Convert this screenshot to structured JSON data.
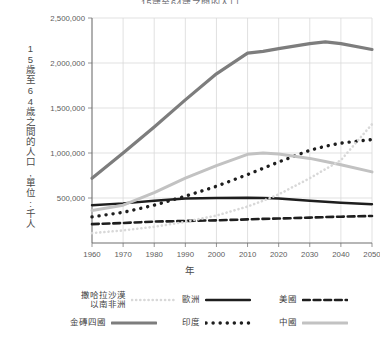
{
  "chart_data": {
    "type": "line",
    "title": "15歲至64歲之間的人口",
    "xlabel": "年",
    "ylabel": "15歲至64歲之間的人口,單位:千人",
    "grid": true,
    "legend_position": "bottom",
    "xlim": [
      1960,
      2050
    ],
    "ylim": [
      0,
      2500000
    ],
    "xticks": [
      1960,
      1970,
      1980,
      1990,
      2000,
      2010,
      2020,
      2030,
      2040,
      2050
    ],
    "xtick_labels": [
      "1960",
      "1970",
      "1980",
      "1990",
      "2000",
      "2010",
      "2020",
      "2030",
      "2040",
      "2050"
    ],
    "yticks": [
      500000,
      1000000,
      1500000,
      2000000,
      2500000
    ],
    "ytick_labels": [
      "500,000",
      "1,000,000",
      "1,500,000",
      "2,000,000",
      "2,500,000"
    ],
    "x": [
      1960,
      1970,
      1980,
      1990,
      2000,
      2010,
      2015,
      2020,
      2030,
      2035,
      2040,
      2050
    ],
    "series": [
      {
        "name": "金磚四國",
        "key": "bric",
        "style": "solid",
        "color": "#7d7d7d",
        "width": 3.2,
        "values": [
          720000,
          1000000,
          1290000,
          1590000,
          1880000,
          2110000,
          2130000,
          2160000,
          2215000,
          2235000,
          2215000,
          2150000
        ]
      },
      {
        "name": "歐洲",
        "key": "europe",
        "style": "solid",
        "color": "#1e1e1e",
        "width": 2.4,
        "values": [
          420000,
          440000,
          470000,
          495000,
          500000,
          503000,
          500000,
          495000,
          470000,
          458000,
          448000,
          430000
        ]
      },
      {
        "name": "美國",
        "key": "usa",
        "style": "dashed",
        "color": "#1e1e1e",
        "width": 2.6,
        "values": [
          210000,
          222000,
          238000,
          245000,
          252000,
          262000,
          268000,
          272000,
          282000,
          288000,
          292000,
          300000
        ]
      },
      {
        "name": "印度",
        "key": "india",
        "style": "dotted",
        "color": "#1e1e1e",
        "width": 3.4,
        "values": [
          290000,
          340000,
          420000,
          520000,
          630000,
          760000,
          830000,
          900000,
          1030000,
          1075000,
          1110000,
          1150000
        ]
      },
      {
        "name": "中國",
        "key": "china",
        "style": "solid",
        "color": "#c2c2c2",
        "width": 3.0,
        "values": [
          360000,
          420000,
          560000,
          720000,
          860000,
          985000,
          1000000,
          990000,
          940000,
          905000,
          870000,
          790000
        ]
      },
      {
        "name": "撒哈拉沙漠\n以南非洲",
        "key": "africa",
        "style": "fine-dotted",
        "color": "#d8d8d8",
        "width": 2.6,
        "values": [
          110000,
          140000,
          180000,
          235000,
          305000,
          405000,
          470000,
          540000,
          720000,
          820000,
          920000,
          1320000
        ]
      }
    ]
  },
  "legend": {
    "items": [
      {
        "label": "撒哈拉沙漠\n以南非洲",
        "key": "africa"
      },
      {
        "label": "歐洲",
        "key": "europe"
      },
      {
        "label": "美國",
        "key": "usa"
      },
      {
        "label": "金磚四國",
        "key": "bric"
      },
      {
        "label": "印度",
        "key": "india"
      },
      {
        "label": "中國",
        "key": "china"
      }
    ]
  },
  "axis": {
    "y_title": "15歲至64歲之間的人口,單位:千人",
    "x_title": "年"
  }
}
